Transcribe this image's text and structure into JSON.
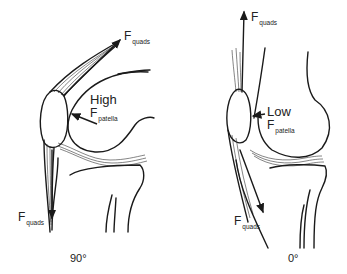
{
  "figure": {
    "panels": [
      {
        "id": "flexion-90",
        "angle_label": "90°",
        "top_force": {
          "symbol": "F",
          "subscript": "quads"
        },
        "bottom_force": {
          "symbol": "F",
          "subscript": "quads"
        },
        "patella_force": {
          "magnitude": "High",
          "symbol": "F",
          "subscript": "patella"
        }
      },
      {
        "id": "flexion-0",
        "angle_label": "0°",
        "top_force": {
          "symbol": "F",
          "subscript": "quads"
        },
        "bottom_force": {
          "symbol": "F",
          "subscript": "quads"
        },
        "patella_force": {
          "magnitude": "Low",
          "symbol": "F",
          "subscript": "patella"
        }
      }
    ],
    "colors": {
      "line": "#1a1a1a",
      "background": "#ffffff",
      "text": "#222222"
    }
  }
}
